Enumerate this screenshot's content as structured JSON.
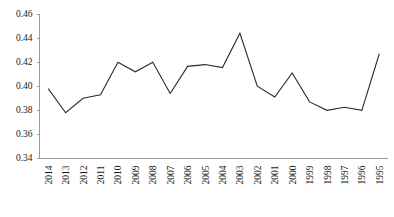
{
  "chart_data": {
    "type": "line",
    "title": "",
    "subtitle": "",
    "xlabel": "",
    "ylabel": "",
    "categories": [
      "2014",
      "2013",
      "2012",
      "2011",
      "2010",
      "2009",
      "2008",
      "2007",
      "2006",
      "2005",
      "2004",
      "2003",
      "2002",
      "2001",
      "2000",
      "1999",
      "1998",
      "1997",
      "1996",
      "1995"
    ],
    "values": [
      0.398,
      0.378,
      0.39,
      0.393,
      0.42,
      0.412,
      0.42,
      0.394,
      0.4165,
      0.418,
      0.4155,
      0.444,
      0.4,
      0.391,
      0.411,
      0.387,
      0.38,
      0.3825,
      0.38,
      0.427
    ],
    "series": [
      {
        "name": "series-1",
        "values": [
          0.398,
          0.378,
          0.39,
          0.393,
          0.42,
          0.412,
          0.42,
          0.394,
          0.4165,
          0.418,
          0.4155,
          0.444,
          0.4,
          0.391,
          0.411,
          0.387,
          0.38,
          0.3825,
          0.38,
          0.427
        ]
      }
    ],
    "ylim": [
      0.34,
      0.46
    ],
    "ytick_values": [
      0.34,
      0.36,
      0.38,
      0.4,
      0.42,
      0.44,
      0.46
    ],
    "ytick_labels": [
      "0.34",
      "0.36",
      "0.38",
      "0.40",
      "0.42",
      "0.44",
      "0.46"
    ],
    "xtick_labels": [
      "2014",
      "2013",
      "2012",
      "2011",
      "2010",
      "2009",
      "2008",
      "2007",
      "2006",
      "2005",
      "2004",
      "2003",
      "2002",
      "2001",
      "2000",
      "1999",
      "1998",
      "1997",
      "1996",
      "1995"
    ],
    "xtick_rotation": -90,
    "grid": false,
    "legend": false,
    "legend_position": "none",
    "line_color": "#2b2b2b",
    "axis_color": "#9a9a9a",
    "background_color": "#ffffff"
  }
}
